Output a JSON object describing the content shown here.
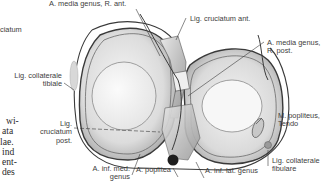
{
  "figure": {
    "labels": {
      "a_media_genus_r_ant": "A. media genus, R. ant.",
      "lig_cruciatum_ant": "Lig. cruciatum ant.",
      "a_media_genus_r_post_line1": "A. media genus,",
      "a_media_genus_r_post_line2": "R. post.",
      "lig_collaterale_tibiale_line1": "Lig. collaterale",
      "lig_collaterale_tibiale_line2": "tibiale",
      "lig_cruciatum_post_line1": "Lig.",
      "lig_cruciatum_post_line2": "cruciatum",
      "lig_cruciatum_post_line3": "post.",
      "m_popliteus_line1": "M. popliteus,",
      "m_popliteus_line2": "Tendo",
      "lig_collaterale_fibulare_line1": "Lig. collaterale",
      "lig_collaterale_fibulare_line2": "fibulare",
      "a_inf_med_genus_line1": "A. inf. med.",
      "a_inf_med_genus_line2": "genus",
      "a_poplitea": "A. poplitea",
      "a_inf_lat_genus": "A. inf. lat. genus",
      "cut_off_ciatum": "ciatum"
    }
  },
  "body_text_fragments": [
    "wi-",
    "ata",
    "lae.",
    "ind",
    "ent-",
    "des"
  ]
}
